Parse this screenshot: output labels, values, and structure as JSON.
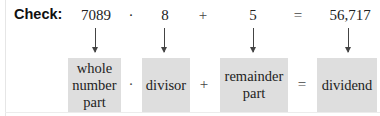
{
  "label": "Check:",
  "equation": {
    "quotient": "7089",
    "divisor": "8",
    "remainder": "5",
    "dividend": "56,717",
    "times_op": "·",
    "plus_op": "+",
    "equals_op": "="
  },
  "boxes": {
    "whole_number_part": [
      "whole",
      "number",
      "part"
    ],
    "divisor": "divisor",
    "remainder_part": [
      "remainder",
      "part"
    ],
    "dividend": "dividend"
  },
  "colors": {
    "box_fill": "#dedede",
    "arrow": "#444444",
    "text": "#222222"
  }
}
